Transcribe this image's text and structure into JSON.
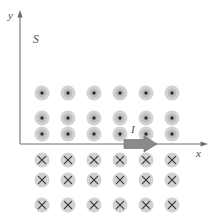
{
  "figure": {
    "background_color": "#ffffff"
  },
  "axes": {
    "origin": {
      "x": 20,
      "y": 144
    },
    "x_axis": {
      "label": "x",
      "label_position": {
        "x": 196,
        "y": 157
      },
      "start": {
        "x": 20,
        "y": 144
      },
      "end": {
        "x": 204,
        "y": 144
      },
      "color": "#6e6e6e"
    },
    "y_axis": {
      "label": "y",
      "label_position": {
        "x": 8,
        "y": 19
      },
      "start": {
        "x": 20,
        "y": 144
      },
      "end": {
        "x": 20,
        "y": 14
      },
      "color": "#6e6e6e"
    }
  },
  "region_label": {
    "text": "S",
    "position": {
      "x": 33,
      "y": 43
    }
  },
  "current_label": {
    "text": "I",
    "position": {
      "x": 131,
      "y": 133
    }
  },
  "current_arrow": {
    "name": "current-arrow",
    "direction": "right",
    "tail_x": 124,
    "tip_x": 157,
    "center_y": 144,
    "shaft_half_height": 4.5,
    "head_half_height": 8,
    "head_length": 13,
    "fill_color": "#8a8a8a"
  },
  "field_symbols": {
    "columns_x": [
      42,
      68,
      94,
      120,
      146,
      172
    ],
    "out_of_page": {
      "symbol": "dot",
      "meaning": "field out of page",
      "rows_y": [
        93,
        118,
        134
      ],
      "outer_radius": 7.5,
      "mid_radius": 4.5,
      "core_radius": 1.7
    },
    "into_page": {
      "symbol": "x",
      "meaning": "field into page",
      "rows_y": [
        160,
        180,
        205
      ],
      "outer_radius": 7.5,
      "cross_half": 3.6
    }
  },
  "colors": {
    "symbol_outer": "#d2d2d2",
    "symbol_mid": "#bdbdbd",
    "symbol_core": "#2b2b2b",
    "axis": "#6e6e6e",
    "arrow": "#8a8a8a",
    "label_text": "#4a4a4a"
  }
}
